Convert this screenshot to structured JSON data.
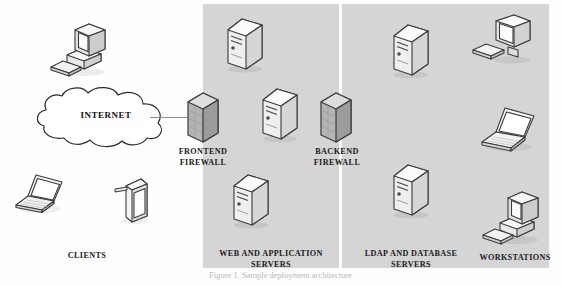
{
  "figure": {
    "caption": "Figure 1. Sample deployment architecture",
    "background": "#ffffff",
    "zone_fill": "#d5d5d5"
  },
  "zones": [
    {
      "id": "dmz-web",
      "label_line1": "WEB AND APPLICATION",
      "label_line2": "SERVERS"
    },
    {
      "id": "ldap-db",
      "label_line1": "LDAP AND DATABASE",
      "label_line2": "SERVERS"
    }
  ],
  "groups": {
    "clients": {
      "label": "CLIENTS"
    },
    "workstations": {
      "label": "WORKSTATIONS"
    }
  },
  "cloud": {
    "label": "INTERNET"
  },
  "firewalls": [
    {
      "id": "frontend",
      "label_line1": "FRONTEND",
      "label_line2": "FIREWALL"
    },
    {
      "id": "backend",
      "label_line1": "BACKEND",
      "label_line2": "FIREWALL"
    }
  ],
  "nodes": [
    {
      "name": "client-desktop-computer",
      "type": "desktop"
    },
    {
      "name": "client-laptop",
      "type": "laptop"
    },
    {
      "name": "client-tablet",
      "type": "tablet"
    },
    {
      "name": "web-server-1",
      "type": "server"
    },
    {
      "name": "web-server-2",
      "type": "server"
    },
    {
      "name": "web-server-3",
      "type": "server"
    },
    {
      "name": "ldap-server-1",
      "type": "server"
    },
    {
      "name": "ldap-server-2",
      "type": "server"
    },
    {
      "name": "workstation-monitor",
      "type": "monitor"
    },
    {
      "name": "workstation-laptop",
      "type": "laptop"
    },
    {
      "name": "workstation-desktop",
      "type": "desktop"
    }
  ],
  "connections": [
    {
      "from": "INTERNET",
      "to": "FRONTEND FIREWALL"
    }
  ]
}
